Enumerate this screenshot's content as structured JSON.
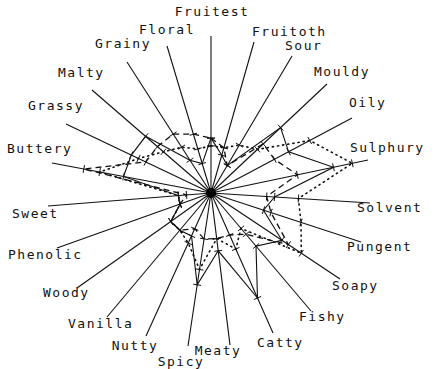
{
  "chart_data": {
    "type": "radar",
    "title": "",
    "center": [
      211,
      193
    ],
    "axes": [
      {
        "name": "Fruitest",
        "end": [
          211,
          36
        ],
        "label_pos": [
          212,
          16
        ],
        "anchor": "middle"
      },
      {
        "name": "Fruitoth",
        "end": [
          254,
          42
        ],
        "label_pos": [
          252,
          36
        ],
        "anchor": "start"
      },
      {
        "name": "Sour",
        "end": [
          292,
          56
        ],
        "label_pos": [
          285,
          50
        ],
        "anchor": "start"
      },
      {
        "name": "Mouldy",
        "end": [
          327,
          84
        ],
        "label_pos": [
          314,
          76
        ],
        "anchor": "start"
      },
      {
        "name": "Oily",
        "end": [
          352,
          118
        ],
        "label_pos": [
          349,
          107
        ],
        "anchor": "start"
      },
      {
        "name": "Sulphury",
        "end": [
          368,
          160
        ],
        "label_pos": [
          350,
          152
        ],
        "anchor": "start"
      },
      {
        "name": "Solvent",
        "end": [
          370,
          203
        ],
        "label_pos": [
          357,
          212
        ],
        "anchor": "start"
      },
      {
        "name": "Pungent",
        "end": [
          361,
          242
        ],
        "label_pos": [
          347,
          251
        ],
        "anchor": "start"
      },
      {
        "name": "Soapy",
        "end": [
          340,
          279
        ],
        "label_pos": [
          332,
          290
        ],
        "anchor": "start"
      },
      {
        "name": "Fishy",
        "end": [
          311,
          311
        ],
        "label_pos": [
          299,
          321
        ],
        "anchor": "start"
      },
      {
        "name": "Catty",
        "end": [
          273,
          333
        ],
        "label_pos": [
          257,
          347
        ],
        "anchor": "start"
      },
      {
        "name": "Meaty",
        "end": [
          230,
          345
        ],
        "label_pos": [
          218,
          355
        ],
        "anchor": "middle"
      },
      {
        "name": "Spicy",
        "end": [
          188,
          346
        ],
        "label_pos": [
          181,
          366
        ],
        "anchor": "middle"
      },
      {
        "name": "Nutty",
        "end": [
          146,
          336
        ],
        "label_pos": [
          135,
          350
        ],
        "anchor": "middle"
      },
      {
        "name": "Vanilla",
        "end": [
          107,
          317
        ],
        "label_pos": [
          68,
          328
        ],
        "anchor": "start"
      },
      {
        "name": "Woody",
        "end": [
          77,
          288
        ],
        "label_pos": [
          43,
          297
        ],
        "anchor": "start"
      },
      {
        "name": "Phenolic",
        "end": [
          57,
          248
        ],
        "label_pos": [
          8,
          259
        ],
        "anchor": "start"
      },
      {
        "name": "Sweet",
        "end": [
          48,
          206
        ],
        "label_pos": [
          12,
          218
        ],
        "anchor": "start"
      },
      {
        "name": "Buttery",
        "end": [
          52,
          163
        ],
        "label_pos": [
          7,
          153
        ],
        "anchor": "start"
      },
      {
        "name": "Grassy",
        "end": [
          66,
          124
        ],
        "label_pos": [
          28,
          110
        ],
        "anchor": "start"
      },
      {
        "name": "Malty",
        "end": [
          92,
          90
        ],
        "label_pos": [
          58,
          77
        ],
        "anchor": "start"
      },
      {
        "name": "Grainy",
        "end": [
          127,
          62
        ],
        "label_pos": [
          95,
          48
        ],
        "anchor": "start"
      },
      {
        "name": "Floral",
        "end": [
          167,
          46
        ],
        "label_pos": [
          139,
          34
        ],
        "anchor": "start"
      }
    ],
    "series": [
      {
        "name": "Series A",
        "style": "solid",
        "values": [
          0.35,
          0.25,
          0.2,
          0.6,
          0.55,
          0.78,
          0.4,
          0.35,
          0.55,
          0.45,
          0.75,
          0.38,
          0.6,
          0.3,
          0.3,
          0.3,
          0.2,
          0.2,
          0.55,
          0.55,
          0.55,
          0.25,
          0.2
        ]
      },
      {
        "name": "Series B",
        "style": "dashed",
        "values": [
          0.35,
          0.3,
          0.2,
          0.45,
          0.45,
          0.55,
          0.35,
          0.4,
          0.6,
          0.35,
          0.3,
          0.3,
          0.3,
          0.25,
          0.3,
          0.3,
          0.2,
          0.15,
          0.8,
          0.45,
          0.45,
          0.45,
          0.4
        ]
      },
      {
        "name": "Series C",
        "style": "dotted",
        "values": [
          0.3,
          0.3,
          0.35,
          0.4,
          0.7,
          0.9,
          0.55,
          0.6,
          0.7,
          0.3,
          0.4,
          0.3,
          0.5,
          0.35,
          0.3,
          0.3,
          0.2,
          0.2,
          0.7,
          0.5,
          0.4,
          0.35,
          0.3
        ]
      }
    ],
    "legend": "none",
    "grid": false
  }
}
